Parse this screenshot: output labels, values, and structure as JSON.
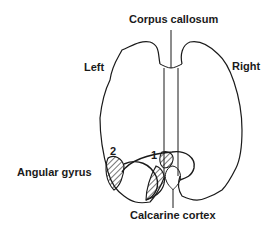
{
  "labels": {
    "corpus_callosum": "Corpus callosum",
    "left": "Left",
    "right": "Right",
    "angular_gyrus": "Angular gyrus",
    "calcarine_cortex": "Calcarine cortex",
    "region_1": "1",
    "region_2": "2"
  },
  "colors": {
    "stroke": "#1a1a1a",
    "background": "#ffffff"
  }
}
